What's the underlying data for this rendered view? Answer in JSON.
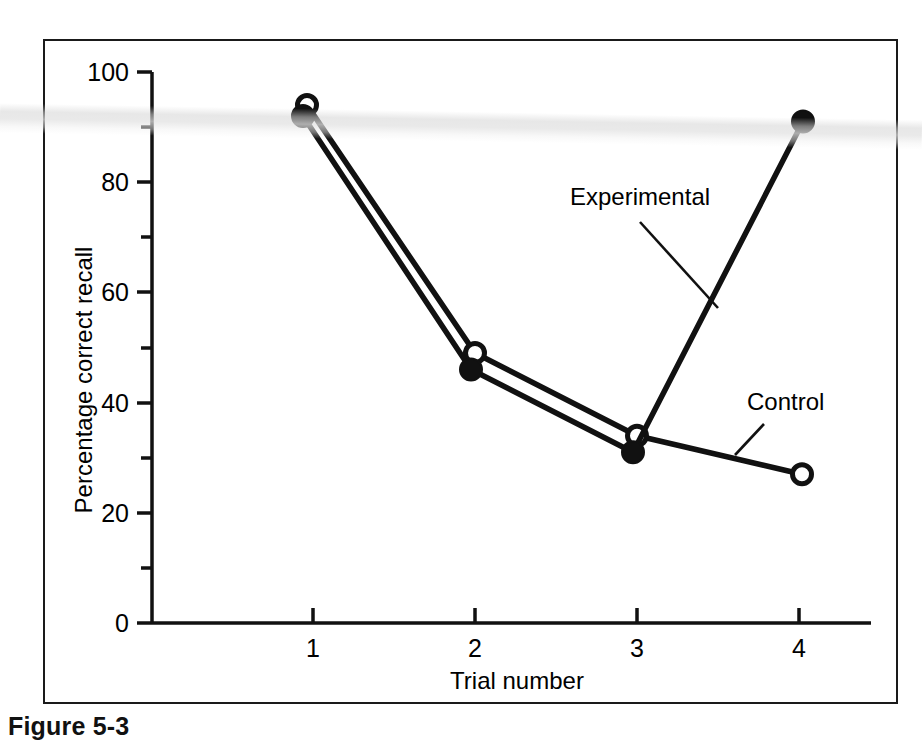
{
  "figure": {
    "caption": "Figure 5-3"
  },
  "chart_data": {
    "type": "line",
    "title": "",
    "xlabel": "Trial number",
    "ylabel": "Percentage correct recall",
    "x": [
      1,
      2,
      3,
      4
    ],
    "xticklabels": [
      "1",
      "2",
      "3",
      "4"
    ],
    "xlim": [
      0.45,
      4.6
    ],
    "ylim": [
      0,
      100
    ],
    "yticks": [
      0,
      20,
      40,
      60,
      80,
      100
    ],
    "yticklabels": [
      "0",
      "20",
      "40",
      "60",
      "80",
      "100"
    ],
    "yminorticks": [
      10,
      30,
      50,
      70,
      90
    ],
    "grid": false,
    "legend_position": "inline-annotations",
    "series": [
      {
        "name": "Experimental",
        "marker": "filled-circle",
        "values": [
          92,
          46,
          31,
          91
        ]
      },
      {
        "name": "Control",
        "marker": "open-circle",
        "values": [
          94,
          49,
          34,
          27
        ]
      }
    ],
    "annotations": [
      {
        "text": "Experimental",
        "target_series": "Experimental",
        "label_x": 570,
        "label_y": 205
      },
      {
        "text": "Control",
        "target_series": "Control",
        "label_x": 747,
        "label_y": 410
      }
    ]
  }
}
